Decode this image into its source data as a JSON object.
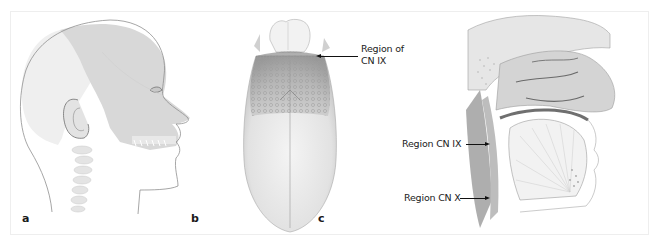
{
  "figure": {
    "panels": [
      {
        "id": "a",
        "letter": "a",
        "subject": "lateral head profile with shaded sensory region",
        "callouts": []
      },
      {
        "id": "b",
        "letter": "b",
        "subject": "dorsal view of tongue",
        "callouts": [
          {
            "line1": "Region of",
            "line2": "CN IX"
          }
        ]
      },
      {
        "id": "c",
        "letter": "c",
        "subject": "midsagittal section of head and neck",
        "callouts": [
          {
            "text": "Region CN IX"
          },
          {
            "text": "Region CN X"
          }
        ]
      }
    ],
    "colors": {
      "frame_border": "#eeeeee",
      "region_shade": "#d6d6d6",
      "outline": "#9a9a9a",
      "text": "#222222",
      "arrow": "#111111"
    }
  }
}
